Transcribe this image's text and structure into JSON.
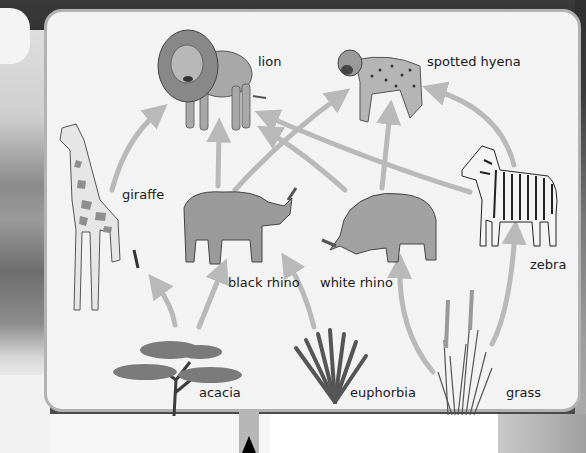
{
  "diagram": {
    "type": "food-web",
    "organisms": {
      "lion": {
        "label": "lion",
        "role": "predator"
      },
      "spotted_hyena": {
        "label": "spotted hyena",
        "role": "predator"
      },
      "giraffe": {
        "label": "giraffe",
        "role": "herbivore"
      },
      "black_rhino": {
        "label": "black rhino",
        "role": "herbivore"
      },
      "white_rhino": {
        "label": "white rhino",
        "role": "herbivore"
      },
      "zebra": {
        "label": "zebra",
        "role": "herbivore"
      },
      "acacia": {
        "label": "acacia",
        "role": "producer"
      },
      "euphorbia": {
        "label": "euphorbia",
        "role": "producer"
      },
      "grass": {
        "label": "grass",
        "role": "producer"
      }
    },
    "arrows": [
      {
        "from": "giraffe",
        "to": "lion"
      },
      {
        "from": "black_rhino",
        "to": "lion"
      },
      {
        "from": "black_rhino",
        "to": "spotted_hyena"
      },
      {
        "from": "white_rhino",
        "to": "lion"
      },
      {
        "from": "white_rhino",
        "to": "spotted_hyena"
      },
      {
        "from": "zebra",
        "to": "lion"
      },
      {
        "from": "zebra",
        "to": "spotted_hyena"
      },
      {
        "from": "acacia",
        "to": "giraffe"
      },
      {
        "from": "acacia",
        "to": "black_rhino"
      },
      {
        "from": "euphorbia",
        "to": "black_rhino"
      },
      {
        "from": "grass",
        "to": "white_rhino"
      },
      {
        "from": "grass",
        "to": "zebra"
      }
    ],
    "colors": {
      "arrow": "#b9b9b9",
      "panel_bg": "#f3f3f3",
      "panel_border": "#b2b2b2",
      "label_text": "#1a1a1a"
    }
  }
}
